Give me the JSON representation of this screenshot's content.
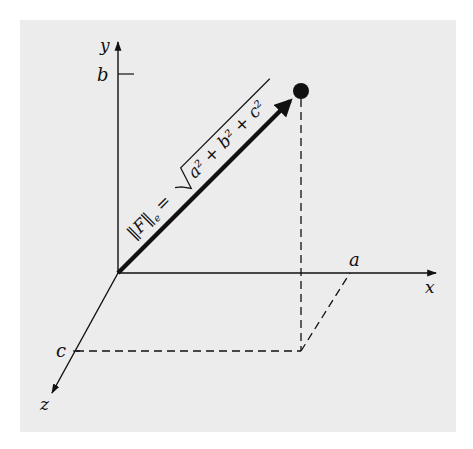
{
  "figure": {
    "background_color": "#ececec",
    "line_color": "#111111",
    "axes": {
      "x": {
        "label": "x",
        "tick_label": "a"
      },
      "y": {
        "label": "y",
        "tick_label": "b"
      },
      "z": {
        "label": "z",
        "tick_label": "c"
      }
    },
    "vector": {
      "formula_lhs": "‖F‖",
      "formula_sub": "e",
      "formula_eq": "=",
      "formula_rhs": "a² + b² + c²",
      "endpoint": "(a, b, c)"
    }
  }
}
